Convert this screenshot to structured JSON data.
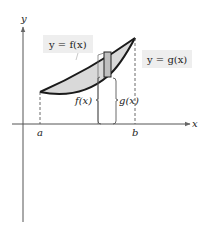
{
  "diagram": {
    "type": "area-between-curves",
    "axes": {
      "x_label": "x",
      "y_label": "y"
    },
    "upper_curve_label": "y = f(x)",
    "lower_curve_label": "y = g(x)",
    "left_bound_label": "a",
    "right_bound_label": "b",
    "brace_upper_label": "f(x)",
    "brace_lower_label": "g(x)",
    "colors": {
      "region_fill": "#d9d9d9",
      "curve_stroke": "#1a1a1a",
      "rectangle_fill": "#bfbfbf",
      "label_box_bg": "#eeeeee",
      "axis_stroke": "#555555"
    }
  }
}
